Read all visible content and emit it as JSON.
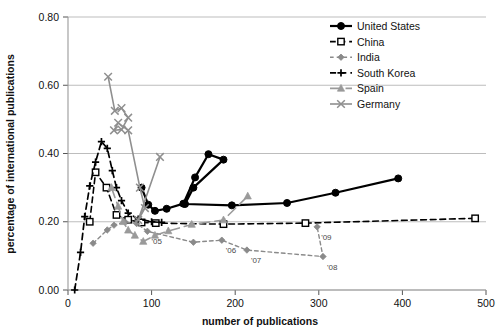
{
  "chart_data": {
    "type": "line",
    "title": "",
    "xlabel": "number of publications",
    "ylabel": "percentage of international publications",
    "xlim": [
      0,
      500
    ],
    "ylim": [
      0.0,
      0.8
    ],
    "xticks": [
      0,
      100,
      200,
      300,
      400,
      500
    ],
    "xtick_labels": [
      "0",
      "100",
      "200",
      "300",
      "400",
      "500"
    ],
    "yticks": [
      0.0,
      0.2,
      0.4,
      0.6,
      0.8
    ],
    "ytick_labels": [
      "0.00",
      "0.20",
      "0.40",
      "0.60",
      "0.80"
    ],
    "grid": "horizontal",
    "legend_position": "top-right",
    "series": [
      {
        "name": "United States",
        "color": "#000000",
        "dash": "none",
        "marker": "filled-circle",
        "width": 2.2,
        "points": [
          [
            88,
            0.3
          ],
          [
            96,
            0.25
          ],
          [
            104,
            0.232
          ],
          [
            118,
            0.238
          ],
          [
            138,
            0.253
          ],
          [
            152,
            0.33
          ],
          [
            168,
            0.398
          ],
          [
            186,
            0.382
          ],
          [
            150,
            0.3
          ],
          [
            140,
            0.252
          ],
          [
            196,
            0.248
          ],
          [
            262,
            0.255
          ],
          [
            320,
            0.285
          ],
          [
            395,
            0.327
          ]
        ]
      },
      {
        "name": "China",
        "color": "#000000",
        "dash": "dashed",
        "marker": "open-square",
        "width": 1.6,
        "points": [
          [
            26,
            0.2
          ],
          [
            33,
            0.345
          ],
          [
            46,
            0.3
          ],
          [
            58,
            0.22
          ],
          [
            72,
            0.206
          ],
          [
            88,
            0.198
          ],
          [
            105,
            0.196
          ],
          [
            186,
            0.193
          ],
          [
            284,
            0.196
          ],
          [
            487,
            0.21
          ]
        ]
      },
      {
        "name": "India",
        "color": "#8a8a8a",
        "dash": "small-dashed",
        "marker": "small-diamond",
        "width": 1.4,
        "points": [
          [
            30,
            0.137
          ],
          [
            47,
            0.176
          ],
          [
            55,
            0.19
          ],
          [
            68,
            0.2
          ],
          [
            82,
            0.195
          ],
          [
            95,
            0.172
          ],
          [
            150,
            0.14
          ],
          [
            184,
            0.146
          ],
          [
            214,
            0.117
          ],
          [
            305,
            0.098
          ],
          [
            298,
            0.185
          ]
        ],
        "annotations": [
          {
            "label": "'05",
            "x": 95,
            "y": 0.172
          },
          {
            "label": "'06",
            "x": 184,
            "y": 0.146
          },
          {
            "label": "'07",
            "x": 214,
            "y": 0.117
          },
          {
            "label": "'08",
            "x": 305,
            "y": 0.098
          },
          {
            "label": "'09",
            "x": 298,
            "y": 0.185
          }
        ]
      },
      {
        "name": "South Korea",
        "color": "#000000",
        "dash": "dashed",
        "marker": "plus",
        "width": 1.7,
        "points": [
          [
            8,
            0.0
          ],
          [
            15,
            0.11
          ],
          [
            20,
            0.215
          ],
          [
            26,
            0.305
          ],
          [
            33,
            0.375
          ],
          [
            40,
            0.435
          ],
          [
            47,
            0.415
          ],
          [
            53,
            0.35
          ],
          [
            58,
            0.3
          ],
          [
            64,
            0.262
          ],
          [
            72,
            0.225
          ],
          [
            84,
            0.208
          ],
          [
            100,
            0.2
          ],
          [
            112,
            0.198
          ]
        ]
      },
      {
        "name": "Spain",
        "color": "#9a9a9a",
        "dash": "long-dashed",
        "marker": "filled-triangle",
        "width": 1.6,
        "points": [
          [
            52,
            0.3
          ],
          [
            60,
            0.245
          ],
          [
            66,
            0.2
          ],
          [
            72,
            0.175
          ],
          [
            80,
            0.16
          ],
          [
            90,
            0.142
          ],
          [
            104,
            0.16
          ],
          [
            120,
            0.173
          ],
          [
            148,
            0.192
          ],
          [
            186,
            0.205
          ],
          [
            215,
            0.275
          ]
        ]
      },
      {
        "name": "Germany",
        "color": "#8f8f8f",
        "dash": "none",
        "marker": "x",
        "width": 1.6,
        "points": [
          [
            48,
            0.625
          ],
          [
            56,
            0.525
          ],
          [
            64,
            0.533
          ],
          [
            72,
            0.505
          ],
          [
            64,
            0.47
          ],
          [
            55,
            0.468
          ],
          [
            60,
            0.49
          ],
          [
            72,
            0.468
          ],
          [
            86,
            0.3
          ],
          [
            92,
            0.24
          ],
          [
            84,
            0.205
          ],
          [
            110,
            0.39
          ]
        ]
      }
    ]
  },
  "legend": {
    "items": [
      {
        "label": "United States"
      },
      {
        "label": "China"
      },
      {
        "label": "India"
      },
      {
        "label": "South Korea"
      },
      {
        "label": "Spain"
      },
      {
        "label": "Germany"
      }
    ]
  }
}
